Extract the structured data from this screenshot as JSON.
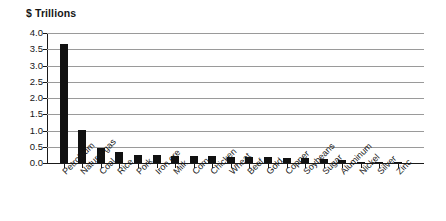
{
  "chart_data": {
    "type": "bar",
    "title": "$ Trillions",
    "xlabel": "",
    "ylabel": "$ Trillions",
    "ylim": [
      0.0,
      4.0
    ],
    "ytick_labels": [
      "4.0",
      "3.5",
      "3.0",
      "2.5",
      "2.0",
      "1.5",
      "1.0",
      "0.5",
      "0.0"
    ],
    "ytick_values": [
      4.0,
      3.5,
      3.0,
      2.5,
      2.0,
      1.5,
      1.0,
      0.5,
      0.0
    ],
    "grid": "horizontal",
    "legend": null,
    "bar_color": "#111111",
    "categories": [
      "Petroleum",
      "Natural gas",
      "Coal",
      "Rice",
      "Pork",
      "Iron ore",
      "Milk",
      "Corn",
      "Chicken",
      "Wheat",
      "Beef",
      "Gold",
      "Copper",
      "Soybeans",
      "Sugar",
      "Aluminum",
      "Nickel",
      "Silver",
      "Zinc"
    ],
    "values": [
      3.65,
      1.02,
      0.46,
      0.33,
      0.25,
      0.24,
      0.22,
      0.22,
      0.21,
      0.2,
      0.19,
      0.18,
      0.16,
      0.15,
      0.12,
      0.1,
      0.04,
      0.03,
      0.03
    ]
  }
}
